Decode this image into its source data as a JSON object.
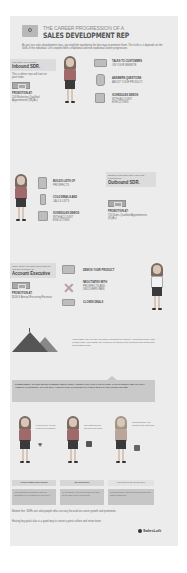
{
  "header": {
    "title_small": "THE CAREER PROGRESSION OF A",
    "title_big": "SALES DEVELOPMENT REP",
    "intro": "As you rise sales development reps, you might be wondering the best way to promote them. The truth is, it depends on the skills of the individual. Let's explore both a traditional and non-traditional career progression."
  },
  "stage1": {
    "callout_small": "let's start your newest",
    "callout_big": "Inbound SDR.",
    "description": "This is where reps will start on your team.",
    "promotion_label": "PROMOTION AT:",
    "promotion_value": "240 Marketing Qualified Appointments (MQAs)",
    "tasks": [
      {
        "icon": "laptop-icon",
        "title": "TALKS TO CUSTOMERS",
        "detail": "ON YOUR WEBSITE"
      },
      {
        "icon": "person-question-icon",
        "title": "ANSWERS QUESTIONS",
        "detail": "ABOUT YOUR PRODUCT"
      },
      {
        "icon": "calendar-icon",
        "title": "SCHEDULES DEMOS",
        "detail": "WITH ACCOUNT EXECUTIVES"
      }
    ]
  },
  "stage2": {
    "callout_small": "thanks to his hard work, she was promoted to",
    "callout_big": "Outbound SDR.",
    "tasks": [
      {
        "icon": "clipboard-icon",
        "title": "BUILDS LISTS OF",
        "detail": "PROSPECTS"
      },
      {
        "icon": "phone-icon",
        "title": "COLD EMAILS AND",
        "detail": "CALLS LISTS"
      },
      {
        "icon": "calendar-icon",
        "title": "SCHEDULES DEMOS",
        "detail": "WITH ACCOUNT EXECUTIVES"
      }
    ],
    "promotion_label": "PROMOTION AT:",
    "promotion_value": "720 Sales Qualified Appointments (SQAs)"
  },
  "stage3": {
    "callout_small": "Once again, her hard work paid off and she became an",
    "callout_big": "Account Executive",
    "promotion_label": "PROMOTION AT:",
    "promotion_value": "$100 K Annual Recurring Revenue",
    "tasks": [
      {
        "icon": "monitor-icon",
        "title": "DEMOS YOUR PRODUCT",
        "detail": ""
      },
      {
        "icon": "cross-icon",
        "title": "NEGOTIATES WITH",
        "detail": "PROSPECTS AND UNCOVERS PAIN"
      },
      {
        "icon": "money-icon",
        "title": "CLOSES DEALS",
        "detail": ""
      }
    ]
  },
  "summit": {
    "text": "If successful, the rep may be further promoted to a Senior Account Executive with a larger book, and outside the company to tackling new territories and guiding the newest sales reps."
  },
  "banner": {
    "text": "SOMETIMES, SALES DEVELOPMENT REPS JUST AREN'T CUT OUT FOR SALES. THIS DOESN'T MEAN THEY AREN'T TALENTED, THAT'S WHY THE SHARE TO DEVELOP THEIR SKILLS ON OTHER TEAMS."
  },
  "alternatives": [
    {
      "label": "CUSTOMER SUCCESS",
      "bubble": "It could be so you can teach a new customer",
      "icon": "heart-icon",
      "desc": "Your customers can quickly retain an empathetic to our customer to help them."
    },
    {
      "label": "MARKETING",
      "bubble": "Get outside the box and learn new ideas",
      "icon": "megaphone-icon",
      "desc": "As a marketer, you will generate the leads for the SDR you've worked with."
    },
    {
      "label": "PRODUCT MARKETING",
      "bubble": "Learning to take your product to the right ideas",
      "icon": "chart-icon",
      "desc": "With good skills, learning the product can help dictate positioning."
    }
  ],
  "closing": {
    "line1": "Bottom line: SDRs are salespeople who can vary focused on career growth and promotion.",
    "line2": "Having key goals also is a good way to create a great culture and retain team."
  },
  "footer": {
    "logo_text": "SalesLoft"
  }
}
